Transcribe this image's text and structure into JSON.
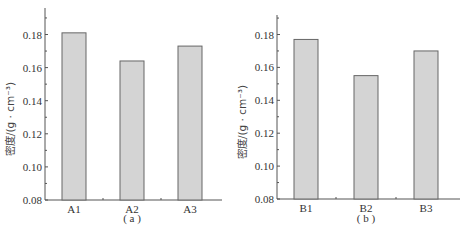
{
  "chart_data": [
    {
      "type": "bar",
      "panel": "a",
      "caption": "( a )",
      "categories": [
        "A1",
        "A2",
        "A3"
      ],
      "values": [
        0.181,
        0.164,
        0.173
      ],
      "title": "",
      "xlabel": "",
      "ylabel": "密度/(g · cm⁻³)",
      "ylim": [
        0.08,
        0.19
      ],
      "yticks": [
        0.08,
        0.1,
        0.12,
        0.14,
        0.16,
        0.18
      ],
      "ytick_labels": [
        "0.08",
        "0.10",
        "0.12",
        "0.14",
        "0.16",
        "0.18"
      ],
      "grid": false,
      "legend": "none"
    },
    {
      "type": "bar",
      "panel": "b",
      "caption": "( b )",
      "categories": [
        "B1",
        "B2",
        "B3"
      ],
      "values": [
        0.177,
        0.155,
        0.17
      ],
      "title": "",
      "xlabel": "",
      "ylabel": "密度/(g · cm⁻³)",
      "ylim": [
        0.08,
        0.19
      ],
      "yticks": [
        0.08,
        0.1,
        0.12,
        0.14,
        0.16,
        0.18
      ],
      "ytick_labels": [
        "0.08",
        "0.10",
        "0.12",
        "0.14",
        "0.16",
        "0.18"
      ],
      "grid": false,
      "legend": "none"
    }
  ]
}
